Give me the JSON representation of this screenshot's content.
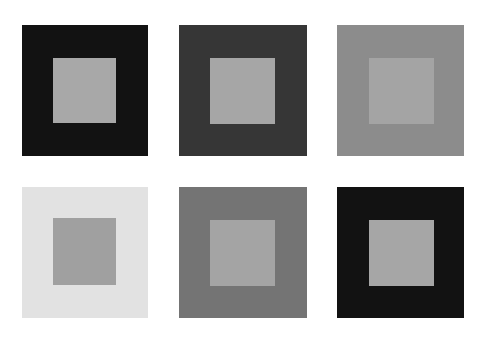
{
  "figure": {
    "squares": [
      {
        "id": 1,
        "outer": {
          "x": 22,
          "y": 25,
          "w": 126,
          "h": 131,
          "color": "#121212"
        },
        "inner": {
          "x": 53,
          "y": 58,
          "w": 63,
          "h": 65,
          "color": "#a8a8a8"
        }
      },
      {
        "id": 2,
        "outer": {
          "x": 179,
          "y": 25,
          "w": 128,
          "h": 131,
          "color": "#363636"
        },
        "inner": {
          "x": 210,
          "y": 58,
          "w": 65,
          "h": 66,
          "color": "#a6a6a6"
        }
      },
      {
        "id": 3,
        "outer": {
          "x": 337,
          "y": 25,
          "w": 127,
          "h": 131,
          "color": "#8c8c8c"
        },
        "inner": {
          "x": 369,
          "y": 58,
          "w": 65,
          "h": 66,
          "color": "#a4a4a4"
        }
      },
      {
        "id": 4,
        "outer": {
          "x": 22,
          "y": 187,
          "w": 126,
          "h": 131,
          "color": "#e2e2e2"
        },
        "inner": {
          "x": 53,
          "y": 218,
          "w": 63,
          "h": 67,
          "color": "#a0a0a0"
        }
      },
      {
        "id": 5,
        "outer": {
          "x": 179,
          "y": 187,
          "w": 128,
          "h": 131,
          "color": "#747474"
        },
        "inner": {
          "x": 210,
          "y": 220,
          "w": 65,
          "h": 66,
          "color": "#a4a4a4"
        }
      },
      {
        "id": 6,
        "outer": {
          "x": 337,
          "y": 187,
          "w": 127,
          "h": 131,
          "color": "#121212"
        },
        "inner": {
          "x": 369,
          "y": 220,
          "w": 65,
          "h": 66,
          "color": "#a6a6a6"
        }
      }
    ]
  }
}
